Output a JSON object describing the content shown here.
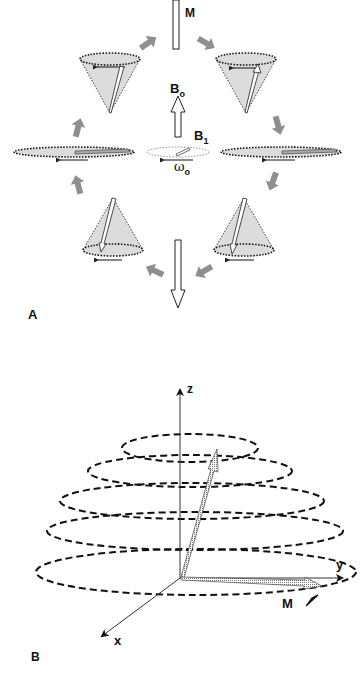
{
  "panel_a": {
    "label": "A",
    "magnetization_label": "M",
    "static_field_label": "B",
    "static_field_sub": "o",
    "rf_field_label": "B",
    "rf_field_sub": "1",
    "precession_label": "ω",
    "precession_sub": "o",
    "colors": {
      "cone_fill": "#dcdcdc",
      "block_arrow": "#8c8c8c",
      "line": "#222222"
    }
  },
  "panel_b": {
    "label": "B",
    "axis_z": "z",
    "axis_y": "y",
    "axis_x": "x",
    "magnetization_label": "M",
    "spiral_turns": 5
  }
}
